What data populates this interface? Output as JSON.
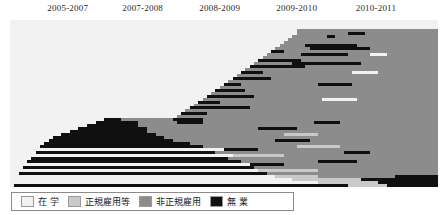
{
  "chart_data": {
    "type": "heatmap",
    "title": "",
    "xlabel": "",
    "ylabel": "",
    "grid": false,
    "legend_position": "bottom-left",
    "categories": [
      "在 学",
      "正規雇用等",
      "非正規雇用",
      "無 業"
    ],
    "category_codes": [
      "school",
      "regular",
      "nonregular",
      "none"
    ],
    "category_colors": [
      "#f2f2f2",
      "#c9c9c9",
      "#8c8c8c",
      "#101010"
    ],
    "x_tick_labels": [
      "2005-2007",
      "2007-2008",
      "2008-2009",
      "2009-2010",
      "2010-2011"
    ],
    "x_tick_centers_pct": [
      13.5,
      31.0,
      49.0,
      67.0,
      85.5
    ],
    "n_columns": 100,
    "n_rows": 56,
    "note": "Sequence index plot: each row is one individual's employment-status trajectory; each run is [category_code, start_pct, width_pct].",
    "rows": [
      [
        [
          "school",
          0,
          100
        ]
      ],
      [
        [
          "school",
          0,
          100
        ]
      ],
      [
        [
          "school",
          0,
          100
        ]
      ],
      [
        [
          "school",
          0,
          67
        ],
        [
          "nonregular",
          67,
          33
        ]
      ],
      [
        [
          "school",
          0,
          67
        ],
        [
          "nonregular",
          67,
          12
        ],
        [
          "none",
          79,
          4
        ],
        [
          "nonregular",
          83,
          17
        ]
      ],
      [
        [
          "school",
          0,
          66
        ],
        [
          "nonregular",
          66,
          8
        ],
        [
          "none",
          74,
          2
        ],
        [
          "nonregular",
          76,
          24
        ]
      ],
      [
        [
          "school",
          0,
          65
        ],
        [
          "nonregular",
          65,
          35
        ]
      ],
      [
        [
          "school",
          0,
          64
        ],
        [
          "nonregular",
          64,
          36
        ]
      ],
      [
        [
          "school",
          0,
          63
        ],
        [
          "nonregular",
          63,
          6
        ],
        [
          "none",
          69,
          12
        ],
        [
          "nonregular",
          81,
          19
        ]
      ],
      [
        [
          "school",
          0,
          62
        ],
        [
          "nonregular",
          62,
          8
        ],
        [
          "none",
          70,
          14
        ],
        [
          "nonregular",
          84,
          16
        ]
      ],
      [
        [
          "school",
          0,
          61
        ],
        [
          "none",
          61,
          3
        ],
        [
          "nonregular",
          64,
          36
        ]
      ],
      [
        [
          "school",
          0,
          60
        ],
        [
          "nonregular",
          60,
          8
        ],
        [
          "none",
          68,
          11
        ],
        [
          "nonregular",
          79,
          5
        ],
        [
          "school",
          84,
          4
        ],
        [
          "nonregular",
          88,
          12
        ]
      ],
      [
        [
          "school",
          0,
          59
        ],
        [
          "nonregular",
          59,
          41
        ]
      ],
      [
        [
          "school",
          0,
          58
        ],
        [
          "none",
          58,
          10
        ],
        [
          "nonregular",
          68,
          32
        ]
      ],
      [
        [
          "school",
          0,
          57
        ],
        [
          "nonregular",
          57,
          9
        ],
        [
          "none",
          66,
          16
        ],
        [
          "nonregular",
          82,
          18
        ]
      ],
      [
        [
          "school",
          0,
          56
        ],
        [
          "none",
          56,
          13
        ],
        [
          "nonregular",
          69,
          31
        ]
      ],
      [
        [
          "school",
          0,
          55
        ],
        [
          "nonregular",
          55,
          45
        ]
      ],
      [
        [
          "school",
          0,
          54
        ],
        [
          "none",
          54,
          5
        ],
        [
          "nonregular",
          59,
          21
        ],
        [
          "school",
          80,
          6
        ],
        [
          "nonregular",
          86,
          14
        ]
      ],
      [
        [
          "school",
          0,
          53
        ],
        [
          "nonregular",
          53,
          47
        ]
      ],
      [
        [
          "school",
          0,
          52
        ],
        [
          "none",
          52,
          9
        ],
        [
          "nonregular",
          61,
          39
        ]
      ],
      [
        [
          "school",
          0,
          51
        ],
        [
          "nonregular",
          51,
          49
        ]
      ],
      [
        [
          "school",
          0,
          50
        ],
        [
          "none",
          50,
          4
        ],
        [
          "nonregular",
          54,
          18
        ],
        [
          "none",
          72,
          8
        ],
        [
          "nonregular",
          80,
          20
        ]
      ],
      [
        [
          "school",
          0,
          49
        ],
        [
          "nonregular",
          49,
          51
        ]
      ],
      [
        [
          "school",
          0,
          48
        ],
        [
          "none",
          48,
          7
        ],
        [
          "nonregular",
          55,
          45
        ]
      ],
      [
        [
          "school",
          0,
          47
        ],
        [
          "nonregular",
          47,
          53
        ]
      ],
      [
        [
          "school",
          0,
          46
        ],
        [
          "none",
          46,
          11
        ],
        [
          "nonregular",
          57,
          43
        ]
      ],
      [
        [
          "school",
          0,
          45
        ],
        [
          "nonregular",
          45,
          28
        ],
        [
          "school",
          73,
          8
        ],
        [
          "nonregular",
          81,
          19
        ]
      ],
      [
        [
          "school",
          0,
          44
        ],
        [
          "none",
          44,
          5
        ],
        [
          "nonregular",
          49,
          51
        ]
      ],
      [
        [
          "school",
          0,
          43
        ],
        [
          "nonregular",
          43,
          57
        ]
      ],
      [
        [
          "school",
          0,
          42
        ],
        [
          "none",
          42,
          14
        ],
        [
          "nonregular",
          56,
          44
        ]
      ],
      [
        [
          "school",
          0,
          41
        ],
        [
          "nonregular",
          41,
          59
        ]
      ],
      [
        [
          "school",
          0,
          40
        ],
        [
          "none",
          40,
          6
        ],
        [
          "nonregular",
          46,
          54
        ]
      ],
      [
        [
          "school",
          0,
          39
        ],
        [
          "nonregular",
          39,
          61
        ]
      ],
      [
        [
          "school",
          0,
          22
        ],
        [
          "none",
          22,
          4
        ],
        [
          "nonregular",
          26,
          12
        ],
        [
          "none",
          38,
          7
        ],
        [
          "nonregular",
          45,
          55
        ]
      ],
      [
        [
          "school",
          0,
          20
        ],
        [
          "none",
          20,
          10
        ],
        [
          "nonregular",
          30,
          9
        ],
        [
          "none",
          39,
          6
        ],
        [
          "nonregular",
          45,
          26
        ],
        [
          "none",
          71,
          6
        ],
        [
          "nonregular",
          77,
          23
        ]
      ],
      [
        [
          "school",
          0,
          18
        ],
        [
          "none",
          18,
          12
        ],
        [
          "nonregular",
          30,
          70
        ]
      ],
      [
        [
          "school",
          0,
          16
        ],
        [
          "none",
          16,
          16
        ],
        [
          "nonregular",
          32,
          26
        ],
        [
          "none",
          58,
          9
        ],
        [
          "nonregular",
          67,
          33
        ]
      ],
      [
        [
          "school",
          0,
          14
        ],
        [
          "none",
          14,
          18
        ],
        [
          "nonregular",
          32,
          68
        ]
      ],
      [
        [
          "school",
          0,
          12
        ],
        [
          "none",
          12,
          22
        ],
        [
          "nonregular",
          34,
          30
        ],
        [
          "regular",
          64,
          8
        ],
        [
          "nonregular",
          72,
          28
        ]
      ],
      [
        [
          "school",
          0,
          10
        ],
        [
          "none",
          10,
          26
        ],
        [
          "nonregular",
          36,
          64
        ]
      ],
      [
        [
          "school",
          0,
          9
        ],
        [
          "none",
          9,
          29
        ],
        [
          "nonregular",
          38,
          24
        ],
        [
          "none",
          62,
          8
        ],
        [
          "nonregular",
          70,
          30
        ]
      ],
      [
        [
          "school",
          0,
          8
        ],
        [
          "none",
          8,
          34
        ],
        [
          "nonregular",
          42,
          58
        ]
      ],
      [
        [
          "school",
          0,
          7
        ],
        [
          "none",
          7,
          38
        ],
        [
          "nonregular",
          45,
          22
        ],
        [
          "regular",
          67,
          10
        ],
        [
          "nonregular",
          77,
          23
        ]
      ],
      [
        [
          "school",
          0,
          50
        ],
        [
          "none",
          50,
          8
        ],
        [
          "nonregular",
          58,
          42
        ]
      ],
      [
        [
          "school",
          0,
          6
        ],
        [
          "none",
          6,
          42
        ],
        [
          "nonregular",
          48,
          30
        ],
        [
          "none",
          78,
          6
        ],
        [
          "nonregular",
          84,
          16
        ]
      ],
      [
        [
          "school",
          0,
          52
        ],
        [
          "regular",
          52,
          12
        ],
        [
          "nonregular",
          64,
          36
        ]
      ],
      [
        [
          "school",
          0,
          5
        ],
        [
          "none",
          5,
          46
        ],
        [
          "nonregular",
          51,
          49
        ]
      ],
      [
        [
          "school",
          0,
          4
        ],
        [
          "none",
          4,
          50
        ],
        [
          "nonregular",
          54,
          18
        ],
        [
          "none",
          72,
          9
        ],
        [
          "nonregular",
          81,
          19
        ]
      ],
      [
        [
          "school",
          0,
          56
        ],
        [
          "none",
          56,
          8
        ],
        [
          "nonregular",
          64,
          36
        ]
      ],
      [
        [
          "school",
          0,
          3
        ],
        [
          "none",
          3,
          54
        ],
        [
          "nonregular",
          57,
          43
        ]
      ],
      [
        [
          "school",
          0,
          58
        ],
        [
          "regular",
          58,
          14
        ],
        [
          "nonregular",
          72,
          28
        ]
      ],
      [
        [
          "school",
          0,
          2
        ],
        [
          "none",
          2,
          58
        ],
        [
          "nonregular",
          60,
          40
        ]
      ],
      [
        [
          "school",
          0,
          62
        ],
        [
          "regular",
          62,
          10
        ],
        [
          "nonregular",
          72,
          18
        ],
        [
          "none",
          90,
          10
        ]
      ],
      [
        [
          "school",
          0,
          66
        ],
        [
          "regular",
          66,
          16
        ],
        [
          "none",
          82,
          18
        ]
      ],
      [
        [
          "school",
          0,
          72
        ],
        [
          "regular",
          72,
          14
        ],
        [
          "none",
          86,
          14
        ]
      ],
      [
        [
          "school",
          0,
          1
        ],
        [
          "none",
          1,
          78
        ],
        [
          "regular",
          79,
          9
        ],
        [
          "none",
          88,
          12
        ]
      ]
    ]
  }
}
